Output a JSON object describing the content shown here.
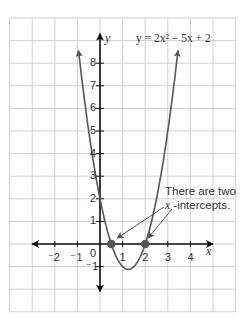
{
  "chart_data": {
    "type": "line",
    "title": "",
    "equation": "y = 2x² − 5x + 2",
    "function": {
      "a": 2,
      "b": -5,
      "c": 2
    },
    "xlabel": "x",
    "ylabel": "y",
    "xlim": [
      -4,
      6
    ],
    "ylim": [
      -3,
      10
    ],
    "grid": true,
    "x_ticks": [
      -2,
      -1,
      0,
      1,
      2,
      3,
      4
    ],
    "x_tick_labels": [
      "⁻2",
      "⁻1",
      "0",
      "1",
      "2",
      "3",
      "4"
    ],
    "y_ticks": [
      -1,
      1,
      2,
      3,
      4,
      5,
      6,
      7,
      8
    ],
    "y_tick_labels": [
      "⁻1",
      "1",
      "2",
      "3",
      "4",
      "5",
      "6",
      "7",
      "8"
    ],
    "x_intercepts": [
      {
        "x": 0.5,
        "y": 0
      },
      {
        "x": 2,
        "y": 0
      }
    ],
    "vertex": {
      "x": 1.25,
      "y": -1.125
    },
    "curve_domain": [
      -0.95,
      3.45
    ],
    "annotation": "There are two x-intercepts.",
    "colors": {
      "curve": "#555555",
      "axis": "#111111",
      "grid": "#d0d0d0",
      "point": "#555555"
    }
  },
  "labels": {
    "equation": "y = 2x² − 5x + 2",
    "x_axis": "x",
    "y_axis": "y",
    "note_line1": "There are two",
    "note_line2_var": "x",
    "note_line2_rest": " -intercepts."
  }
}
